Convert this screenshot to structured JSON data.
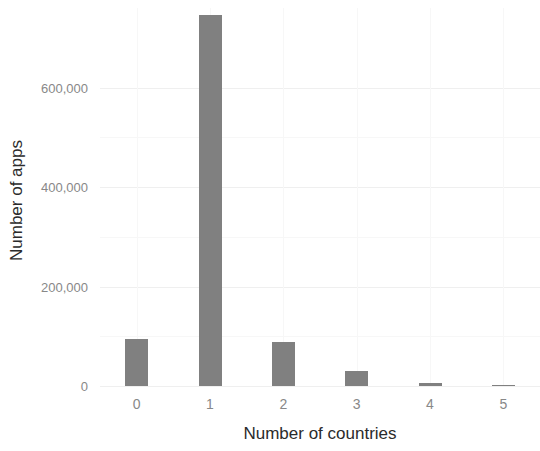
{
  "chart_data": {
    "type": "bar",
    "title": "",
    "subtitle": "",
    "xlabel": "Number of countries",
    "ylabel": "Number of apps",
    "categories": [
      "0",
      "1",
      "2",
      "3",
      "4",
      "5"
    ],
    "values": [
      94000,
      745000,
      88000,
      30000,
      6000,
      1000
    ],
    "series": [
      {
        "name": "Number of apps",
        "values": [
          94000,
          745000,
          88000,
          30000,
          6000,
          1000
        ]
      }
    ],
    "xlim": [
      -0.5,
      5.5
    ],
    "ylim": [
      0,
      760000
    ],
    "y_ticks": [
      0,
      200000,
      400000,
      600000
    ],
    "y_tick_labels": [
      "0",
      "200,000",
      "400,000",
      "600,000"
    ],
    "x_ticks": [
      0,
      1,
      2,
      3,
      4,
      5
    ],
    "x_tick_labels": [
      "0",
      "1",
      "2",
      "3",
      "4",
      "5"
    ],
    "grid": true,
    "grid_axis": "both",
    "legend": false,
    "legend_position": "none",
    "bar_color": "#808080",
    "grid_color": "#efefef",
    "background_color": "#ffffff",
    "tick_label_color": "#888888",
    "axis_title_color": "#2b2b2b",
    "annotations": []
  }
}
